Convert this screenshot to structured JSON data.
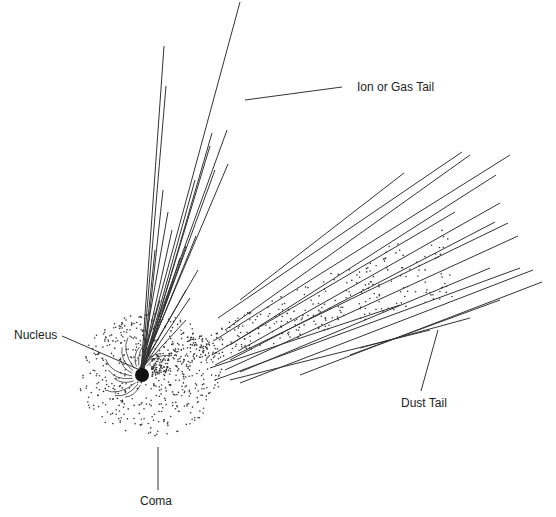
{
  "colors": {
    "ink": "#222222",
    "background": "#ffffff"
  },
  "labels": {
    "ion_tail": "Ion or Gas Tail",
    "dust_tail": "Dust Tail",
    "nucleus": "Nucleus",
    "coma": "Coma"
  },
  "nucleus": {
    "cx": 142,
    "cy": 375,
    "r": 7
  },
  "ion_tail_endpoints": [
    [
      240,
      2
    ],
    [
      164,
      46
    ],
    [
      166,
      86
    ],
    [
      210,
      146
    ],
    [
      212,
      133
    ],
    [
      227,
      130
    ],
    [
      228,
      164
    ],
    [
      215,
      170
    ],
    [
      195,
      180
    ],
    [
      163,
      190
    ],
    [
      168,
      212
    ],
    [
      172,
      230
    ],
    [
      196,
      236
    ],
    [
      186,
      246
    ],
    [
      180,
      258
    ],
    [
      198,
      270
    ],
    [
      186,
      290
    ],
    [
      190,
      298
    ],
    [
      155,
      250
    ],
    [
      173,
      280
    ],
    [
      160,
      300
    ],
    [
      186,
      320
    ]
  ],
  "dust_tail_lines": [
    [
      [
        240,
        300
      ],
      [
        404,
        173
      ]
    ],
    [
      [
        218,
        318
      ],
      [
        462,
        152
      ]
    ],
    [
      [
        225,
        330
      ],
      [
        470,
        155
      ]
    ],
    [
      [
        215,
        340
      ],
      [
        510,
        155
      ]
    ],
    [
      [
        230,
        345
      ],
      [
        496,
        175
      ]
    ],
    [
      [
        212,
        355
      ],
      [
        455,
        212
      ]
    ],
    [
      [
        240,
        350
      ],
      [
        500,
        203
      ]
    ],
    [
      [
        230,
        360
      ],
      [
        495,
        222
      ]
    ],
    [
      [
        215,
        365
      ],
      [
        508,
        223
      ]
    ],
    [
      [
        225,
        370
      ],
      [
        518,
        236
      ]
    ],
    [
      [
        240,
        372
      ],
      [
        490,
        268
      ]
    ],
    [
      [
        215,
        380
      ],
      [
        520,
        268
      ]
    ],
    [
      [
        240,
        383
      ],
      [
        533,
        270
      ]
    ],
    [
      [
        300,
        375
      ],
      [
        542,
        282
      ]
    ],
    [
      [
        350,
        355
      ],
      [
        500,
        300
      ]
    ],
    [
      [
        210,
        368
      ],
      [
        400,
        305
      ]
    ],
    [
      [
        230,
        380
      ],
      [
        430,
        330
      ]
    ],
    [
      [
        360,
        348
      ],
      [
        470,
        318
      ]
    ]
  ],
  "leader_lines": {
    "ion_tail": [
      [
        245,
        100
      ],
      [
        342,
        87
      ]
    ],
    "nucleus": [
      [
        62,
        336
      ],
      [
        140,
        370
      ]
    ],
    "dust_tail": [
      [
        438,
        330
      ],
      [
        421,
        391
      ]
    ],
    "coma": [
      [
        158,
        447
      ],
      [
        158,
        490
      ]
    ]
  }
}
